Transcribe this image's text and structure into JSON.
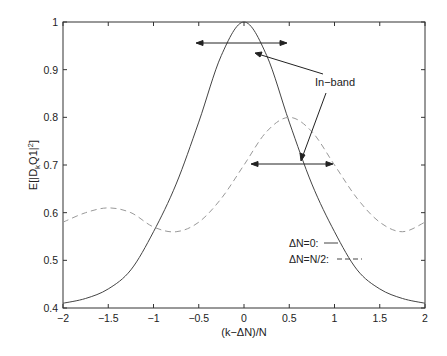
{
  "chart_data": {
    "type": "line",
    "title": "",
    "xlabel": "(k−ΔN)/N",
    "ylabel": "E[|D_k Q1|^2]",
    "xlim": [
      -2,
      2
    ],
    "ylim": [
      0.4,
      1
    ],
    "grid": false,
    "xticks": [
      "−2",
      "−1.5",
      "−1",
      "−0.5",
      "0",
      "0.5",
      "1",
      "1.5",
      "2"
    ],
    "yticks": [
      "0.4",
      "0.5",
      "0.6",
      "0.7",
      "0.8",
      "0.9",
      "1"
    ],
    "legend": {
      "position": "lower right",
      "entries": [
        "ΔN=0:",
        "ΔN=N/2:"
      ]
    },
    "annotations": [
      "In−band"
    ],
    "series": [
      {
        "name": "ΔN=0",
        "style": "solid",
        "x": [
          -2,
          -1.75,
          -1.5,
          -1.25,
          -1,
          -0.75,
          -0.5,
          -0.25,
          0,
          0.25,
          0.5,
          0.75,
          1,
          1.25,
          1.5,
          1.75,
          2
        ],
        "y": [
          0.41,
          0.42,
          0.44,
          0.48,
          0.56,
          0.66,
          0.79,
          0.93,
          1.0,
          0.93,
          0.79,
          0.66,
          0.56,
          0.48,
          0.44,
          0.42,
          0.41
        ]
      },
      {
        "name": "ΔN=N/2",
        "style": "dashed",
        "x": [
          -2,
          -1.75,
          -1.5,
          -1.25,
          -1,
          -0.75,
          -0.5,
          -0.25,
          0,
          0.25,
          0.5,
          0.75,
          1,
          1.25,
          1.5,
          1.75,
          2
        ],
        "y": [
          0.58,
          0.6,
          0.61,
          0.6,
          0.57,
          0.56,
          0.58,
          0.63,
          0.7,
          0.77,
          0.8,
          0.77,
          0.7,
          0.63,
          0.58,
          0.56,
          0.58
        ]
      }
    ]
  }
}
